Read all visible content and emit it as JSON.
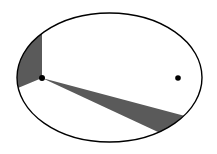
{
  "diagram": {
    "type": "kepler-second-law-orbit",
    "colors": {
      "background": "#ffffff",
      "orbit_stroke": "#000000",
      "sector_fill": "#5a5a5a",
      "focus_fill": "#000000"
    },
    "orbit": {
      "cx": 109.5,
      "cy": 77.5,
      "rx": 92.5,
      "ry": 64.5
    },
    "foci": [
      {
        "name": "occupied-focus",
        "x": 42,
        "y": 78
      },
      {
        "name": "empty-focus",
        "x": 178,
        "y": 78
      }
    ],
    "sectors": [
      {
        "name": "near-perihelion-sector",
        "points": [
          [
            42,
            78
          ],
          [
            42,
            33
          ],
          [
            18,
            88
          ]
        ]
      },
      {
        "name": "near-aphelion-sector",
        "points": [
          [
            42,
            78
          ],
          [
            179,
            118
          ],
          [
            160,
            131
          ]
        ]
      }
    ]
  }
}
